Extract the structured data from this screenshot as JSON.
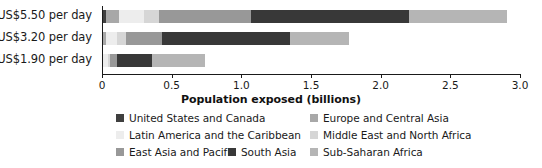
{
  "chart_data": {
    "type": "bar",
    "orientation": "horizontal",
    "stacked": true,
    "title": "",
    "xlabel": "Population exposed (billions)",
    "ylabel": "",
    "xlim": [
      0,
      3.0
    ],
    "xticks": [
      "0",
      "0.5",
      "1.0",
      "1.5",
      "2.0",
      "2.5",
      "3.0"
    ],
    "xtick_values": [
      0,
      0.5,
      1.0,
      1.5,
      2.0,
      2.5,
      3.0
    ],
    "grid": false,
    "legend_position": "bottom",
    "categories": [
      "US$5.50 per day",
      "US$3.20 per day",
      "US$1.90 per day"
    ],
    "series": [
      {
        "name": "United States and Canada",
        "color": "#3f3f3f",
        "values": [
          0.03,
          0.01,
          0.005
        ]
      },
      {
        "name": "Europe and Central Asia",
        "color": "#a8a8a8",
        "values": [
          0.09,
          0.02,
          0.005
        ]
      },
      {
        "name": "Latin America and the Caribbean",
        "color": "#ededed",
        "values": [
          0.18,
          0.08,
          0.03
        ]
      },
      {
        "name": "Middle East and North Africa",
        "color": "#d6d6d6",
        "values": [
          0.11,
          0.06,
          0.02
        ]
      },
      {
        "name": "East Asia and Pacific",
        "color": "#989898",
        "values": [
          0.66,
          0.26,
          0.05
        ]
      },
      {
        "name": "South Asia",
        "color": "#383838",
        "values": [
          1.13,
          0.92,
          0.25
        ]
      },
      {
        "name": "Sub-Saharan Africa",
        "color": "#b5b5b5",
        "values": [
          0.71,
          0.42,
          0.38
        ]
      }
    ],
    "totals": [
      2.91,
      1.77,
      0.74
    ]
  },
  "axis": {
    "x_title": "Population exposed (billions)"
  },
  "legend": {
    "entries": [
      {
        "label": "United States and Canada",
        "color": "#3f3f3f"
      },
      {
        "label": "Europe and Central Asia",
        "color": "#a8a8a8"
      },
      {
        "label": "Latin America and the Caribbean",
        "color": "#ededed"
      },
      {
        "label": "Middle East and North Africa",
        "color": "#d6d6d6"
      },
      {
        "label": "East Asia and Pacific",
        "color": "#989898"
      },
      {
        "label": "South Asia",
        "color": "#383838"
      },
      {
        "label": "Sub-Saharan Africa",
        "color": "#b5b5b5"
      }
    ]
  }
}
